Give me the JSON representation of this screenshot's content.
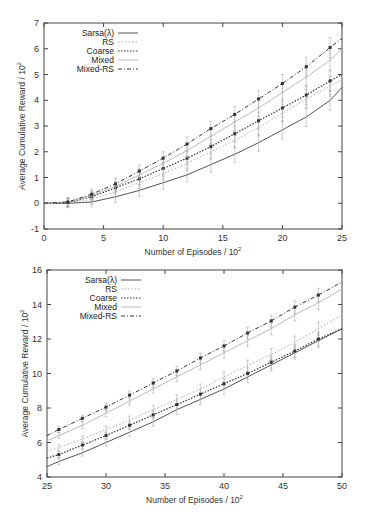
{
  "chart_data": [
    {
      "type": "line",
      "title": "",
      "xlabel": "Number of Episodes / 10^2",
      "ylabel": "Average Cumulative Reward / 10^2",
      "xlim": [
        0,
        25
      ],
      "ylim": [
        -1,
        7
      ],
      "xticks": [
        0,
        5,
        10,
        15,
        20,
        25
      ],
      "yticks": [
        -1,
        0,
        1,
        2,
        3,
        4,
        5,
        6,
        7
      ],
      "grid": false,
      "legend_position": "top-left",
      "x": [
        0,
        2,
        4,
        6,
        8,
        10,
        12,
        14,
        16,
        18,
        20,
        22,
        24,
        25
      ],
      "series": [
        {
          "name": "Sarsa(λ)",
          "style": "solid",
          "values": [
            0,
            0.0,
            0.05,
            0.25,
            0.5,
            0.8,
            1.1,
            1.5,
            1.9,
            2.35,
            2.85,
            3.35,
            4.0,
            4.5
          ]
        },
        {
          "name": "RS",
          "style": "dotted-light",
          "values": [
            0,
            0.02,
            0.15,
            0.45,
            0.8,
            1.15,
            1.55,
            2.0,
            2.45,
            2.95,
            3.5,
            4.05,
            4.55,
            4.8
          ]
        },
        {
          "name": "Coarse",
          "style": "dotted",
          "values": [
            0,
            0.03,
            0.25,
            0.6,
            0.95,
            1.35,
            1.75,
            2.2,
            2.7,
            3.2,
            3.7,
            4.2,
            4.75,
            5.0
          ]
        },
        {
          "name": "Mixed",
          "style": "light-solid",
          "values": [
            0,
            0.04,
            0.3,
            0.65,
            1.1,
            1.55,
            2.05,
            2.6,
            3.15,
            3.7,
            4.3,
            4.9,
            5.55,
            6.0
          ]
        },
        {
          "name": "Mixed-RS",
          "style": "dash-dot",
          "values": [
            0,
            0.05,
            0.35,
            0.75,
            1.25,
            1.75,
            2.3,
            2.9,
            3.45,
            4.05,
            4.65,
            5.3,
            6.05,
            6.4
          ]
        }
      ]
    },
    {
      "type": "line",
      "title": "",
      "xlabel": "Number of Episodes / 10^2",
      "ylabel": "Average Cumulative Reward / 10^2",
      "xlim": [
        25,
        50
      ],
      "ylim": [
        4,
        16
      ],
      "xticks": [
        25,
        30,
        35,
        40,
        45,
        50
      ],
      "yticks": [
        4,
        6,
        8,
        10,
        12,
        14,
        16
      ],
      "grid": false,
      "legend_position": "top-left",
      "x": [
        25,
        26,
        28,
        30,
        32,
        34,
        36,
        38,
        40,
        42,
        44,
        46,
        48,
        50
      ],
      "series": [
        {
          "name": "Sarsa(λ)",
          "style": "solid",
          "values": [
            4.6,
            4.9,
            5.4,
            6.0,
            6.6,
            7.2,
            7.9,
            8.5,
            9.1,
            9.8,
            10.5,
            11.2,
            11.9,
            12.6
          ]
        },
        {
          "name": "RS",
          "style": "dotted-light",
          "values": [
            5.5,
            5.7,
            6.2,
            6.75,
            7.3,
            7.9,
            8.5,
            9.1,
            9.8,
            10.45,
            11.1,
            11.8,
            12.6,
            13.4
          ]
        },
        {
          "name": "Coarse",
          "style": "dotted",
          "values": [
            5.1,
            5.3,
            5.85,
            6.4,
            7.0,
            7.6,
            8.2,
            8.8,
            9.4,
            10.0,
            10.65,
            11.3,
            12.0,
            12.6
          ]
        },
        {
          "name": "Mixed",
          "style": "light-solid",
          "values": [
            6.1,
            6.4,
            7.0,
            7.7,
            8.4,
            9.1,
            9.8,
            10.5,
            11.2,
            11.9,
            12.6,
            13.4,
            14.1,
            14.9
          ]
        },
        {
          "name": "Mixed-RS",
          "style": "dash-dot",
          "values": [
            6.4,
            6.75,
            7.4,
            8.05,
            8.75,
            9.45,
            10.15,
            10.9,
            11.6,
            12.35,
            13.05,
            13.85,
            14.55,
            15.3
          ]
        }
      ]
    }
  ],
  "charts": [
    {
      "ylabel": "Average Cumulative Reward / 10",
      "ylabel_sup": "2",
      "xlabel": "Number of Episodes / 10",
      "xlabel_sup": "2",
      "legend": [
        "Sarsa(λ)",
        "RS",
        "Coarse",
        "Mixed",
        "Mixed-RS"
      ]
    },
    {
      "ylabel": "Average Cumulative Reward / 10",
      "ylabel_sup": "2",
      "xlabel": "Number of Episodes / 10",
      "xlabel_sup": "2",
      "legend": [
        "Sarsa(λ)",
        "RS",
        "Coarse",
        "Mixed",
        "Mixed-RS"
      ]
    }
  ]
}
